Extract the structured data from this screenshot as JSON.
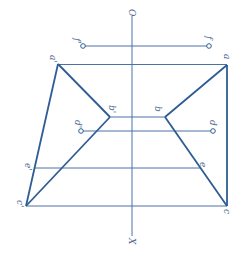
{
  "diagram": {
    "type": "orthographic-projection",
    "orientation": "rotated 90deg clockwise",
    "colors": {
      "line": "#2f5c94",
      "thin_line": "#4a72a8",
      "label": "#4a6590",
      "background": "#ffffff"
    },
    "axis": {
      "top_label": "O",
      "bottom_label": "X",
      "x": 132,
      "y1": 16,
      "y2": 236
    },
    "points": {
      "f_prime": {
        "label": "f'",
        "x": 83,
        "y": 46
      },
      "f": {
        "label": "f",
        "x": 209,
        "y": 46
      },
      "a_prime": {
        "label": "a'",
        "x": 58,
        "y": 64
      },
      "a": {
        "label": "a",
        "x": 227,
        "y": 65
      },
      "b_prime": {
        "label": "b'",
        "x": 110,
        "y": 117
      },
      "b": {
        "label": "b",
        "x": 165,
        "y": 117
      },
      "d_prime": {
        "label": "d'",
        "x": 81,
        "y": 131
      },
      "d": {
        "label": "d",
        "x": 213,
        "y": 131
      },
      "e_prime": {
        "label": "e'",
        "x": 35,
        "y": 168
      },
      "e": {
        "label": "e",
        "x": 201,
        "y": 168
      },
      "c_prime": {
        "label": "c'",
        "x": 26,
        "y": 206
      },
      "c": {
        "label": "c",
        "x": 227,
        "y": 206
      }
    }
  }
}
